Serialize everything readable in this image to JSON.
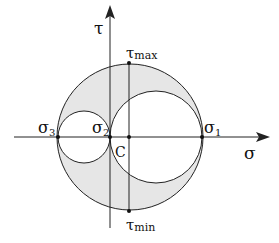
{
  "diagram": {
    "type": "mohr-circle-3d",
    "axes": {
      "horizontal": "σ",
      "vertical": "τ"
    },
    "points": {
      "sigma3": {
        "base": "σ",
        "sub": "3"
      },
      "sigma2": {
        "base": "σ",
        "sub": "2"
      },
      "sigma1": {
        "base": "σ",
        "sub": "1"
      },
      "center": "C",
      "tau_max": {
        "base": "τ",
        "sub": "max"
      },
      "tau_min": {
        "base": "τ",
        "sub": "min"
      }
    },
    "colors": {
      "shaded_region": "#e6e6e6",
      "stroke": "#222222"
    }
  }
}
